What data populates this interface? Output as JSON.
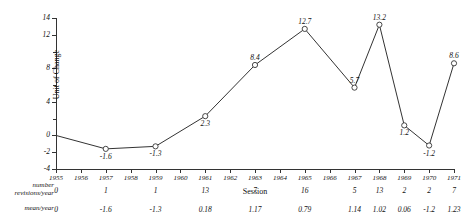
{
  "chart_data": {
    "type": "line",
    "title": "",
    "xlabel": "Session",
    "ylabel": "Unit of Change",
    "x": [
      1955,
      1957,
      1959,
      1961,
      1963,
      1965,
      1967,
      1968,
      1969,
      1970,
      1971
    ],
    "values": [
      0,
      -1.6,
      -1.3,
      2.3,
      8.4,
      12.7,
      5.7,
      13.2,
      1.2,
      -1.2,
      8.6
    ],
    "point_labels": [
      "",
      "-1.6",
      "-1.3",
      "2.3",
      "8.4",
      "12.7",
      "5.7",
      "13.2",
      "1.2",
      "-1.2",
      "8.6"
    ],
    "markers": [
      false,
      true,
      true,
      true,
      true,
      true,
      true,
      true,
      true,
      true,
      true
    ],
    "xlim": [
      1955,
      1971
    ],
    "ylim": [
      -4,
      14
    ],
    "ytick_labels": [
      "14",
      "12",
      "8",
      "4",
      "0",
      "-2",
      "-4"
    ],
    "ytick_values": [
      14,
      12,
      8,
      4,
      0,
      -2,
      -4
    ],
    "ytick_minor_values": [
      10,
      6,
      2
    ],
    "xtick_labels": [
      "1955",
      "1956",
      "1957",
      "1958",
      "1959",
      "1960",
      "1961",
      "1962",
      "1963",
      "1964",
      "1965",
      "1966",
      "1967",
      "1968",
      "1969",
      "1970",
      "1971"
    ],
    "grid": false,
    "legend": "none",
    "line_color": "#333333",
    "marker_fill": "#ffffff"
  },
  "table": {
    "rows": [
      {
        "label_line1": "number",
        "label_line2": "revisions/year",
        "cells": [
          {
            "x": 1955,
            "value": "0"
          },
          {
            "x": 1957,
            "value": "1"
          },
          {
            "x": 1959,
            "value": "1"
          },
          {
            "x": 1961,
            "value": "13"
          },
          {
            "x": 1963,
            "value": "7"
          },
          {
            "x": 1965,
            "value": "16"
          },
          {
            "x": 1967,
            "value": "5"
          },
          {
            "x": 1968,
            "value": "13"
          },
          {
            "x": 1969,
            "value": "2"
          },
          {
            "x": 1970,
            "value": "2"
          },
          {
            "x": 1971,
            "value": "7"
          }
        ]
      },
      {
        "label_line1": "mean/year",
        "label_line2": "",
        "cells": [
          {
            "x": 1955,
            "value": "0"
          },
          {
            "x": 1957,
            "value": "-1.6"
          },
          {
            "x": 1959,
            "value": "-1.3"
          },
          {
            "x": 1961,
            "value": "0.18"
          },
          {
            "x": 1963,
            "value": "1.17"
          },
          {
            "x": 1965,
            "value": "0.79"
          },
          {
            "x": 1967,
            "value": "1.14"
          },
          {
            "x": 1968,
            "value": "1.02"
          },
          {
            "x": 1969,
            "value": "0.06"
          },
          {
            "x": 1970,
            "value": "-1.2"
          },
          {
            "x": 1971,
            "value": "1.23"
          }
        ]
      }
    ]
  }
}
